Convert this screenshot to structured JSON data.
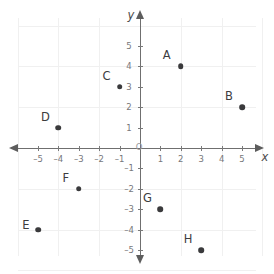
{
  "chart_data": {
    "type": "scatter",
    "title": "",
    "xlabel": "x",
    "ylabel": "y",
    "origin_label": "O",
    "xlim": [
      -6,
      6
    ],
    "ylim": [
      -6,
      6
    ],
    "grid": true,
    "legend": "none",
    "x_ticks": [
      -5,
      -4,
      -3,
      -2,
      -1,
      1,
      2,
      3,
      4,
      5
    ],
    "y_ticks": [
      5,
      4,
      3,
      2,
      1,
      -1,
      -2,
      -3,
      -4,
      -5
    ],
    "x_tick_labels": [
      "–5",
      "–4",
      "–3",
      "–2",
      "–1",
      "1",
      "2",
      "3",
      "4",
      "5"
    ],
    "y_tick_labels": [
      "5",
      "4",
      "3",
      "2",
      "1",
      "–1",
      "–2",
      "–3",
      "–4",
      "–5"
    ],
    "points": [
      {
        "label": "A",
        "x": 2,
        "y": 4,
        "label_dx": -14,
        "label_dy": -11
      },
      {
        "label": "B",
        "x": 5,
        "y": 2,
        "label_dx": -13,
        "label_dy": -11
      },
      {
        "label": "C",
        "x": -1,
        "y": 3,
        "label_dx": -13,
        "label_dy": -11
      },
      {
        "label": "D",
        "x": -4,
        "y": 1,
        "label_dx": -13,
        "label_dy": -11
      },
      {
        "label": "E",
        "x": -5,
        "y": -4,
        "label_dx": -12,
        "label_dy": -5
      },
      {
        "label": "F",
        "x": -3,
        "y": -2,
        "label_dx": -13,
        "label_dy": -11
      },
      {
        "label": "G",
        "x": 1,
        "y": -3,
        "label_dx": -13,
        "label_dy": -11
      },
      {
        "label": "H",
        "x": 3,
        "y": -5,
        "label_dx": -13,
        "label_dy": -11
      }
    ],
    "point_color": "#3a3a3c",
    "axis_color": "#6f6f6f",
    "grid_color": "#f0f0f0",
    "tick_label_color": "#77777a"
  }
}
